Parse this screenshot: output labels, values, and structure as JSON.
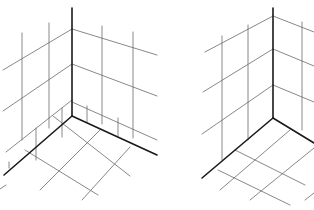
{
  "colors": {
    "background": "#ffffff",
    "thin_line": "#6a6a6a",
    "thick_line": "#1a1a1a"
  },
  "figures": [
    {
      "name": "corner-with-baseboard",
      "thick": [
        [
          72,
          8,
          72,
          116
        ],
        [
          72,
          116,
          4,
          175
        ],
        [
          72,
          116,
          157,
          155
        ]
      ],
      "thin": [
        [
          72,
          29,
          3,
          70
        ],
        [
          72,
          64,
          3,
          111
        ],
        [
          72,
          100,
          6,
          152
        ],
        [
          72,
          29,
          157,
          55
        ],
        [
          72,
          64,
          157,
          96
        ],
        [
          72,
          102,
          157,
          140
        ],
        [
          22,
          33,
          22,
          140
        ],
        [
          49,
          23,
          49,
          128
        ],
        [
          36,
          128,
          36,
          160
        ],
        [
          62,
          108,
          62,
          137
        ],
        [
          102,
          26,
          102,
          124
        ],
        [
          133,
          32,
          133,
          138
        ],
        [
          87,
          106,
          87,
          122
        ],
        [
          118,
          118,
          118,
          136
        ],
        [
          9,
          162,
          9,
          168
        ],
        [
          53,
          116,
          130,
          176
        ],
        [
          25,
          150,
          98,
          195
        ],
        [
          100,
          130,
          40,
          190
        ],
        [
          130,
          147,
          82,
          200
        ],
        [
          6,
          185,
          0,
          189
        ]
      ]
    },
    {
      "name": "corner-plain",
      "thick": [
        [
          273,
          8,
          273,
          118
        ],
        [
          273,
          118,
          202,
          178
        ],
        [
          273,
          118,
          314,
          143
        ]
      ],
      "thin": [
        [
          273,
          16,
          205,
          52
        ],
        [
          273,
          49,
          203,
          92
        ],
        [
          273,
          85,
          202,
          134
        ],
        [
          273,
          16,
          314,
          32
        ],
        [
          273,
          49,
          314,
          66
        ],
        [
          273,
          85,
          314,
          102
        ],
        [
          222,
          36,
          222,
          160
        ],
        [
          248,
          25,
          248,
          140
        ],
        [
          302,
          22,
          302,
          130
        ],
        [
          290,
          130,
          220,
          190
        ],
        [
          314,
          148,
          250,
          200
        ],
        [
          235,
          150,
          305,
          185
        ],
        [
          218,
          170,
          290,
          205
        ],
        [
          305,
          200,
          314,
          193
        ]
      ]
    }
  ]
}
